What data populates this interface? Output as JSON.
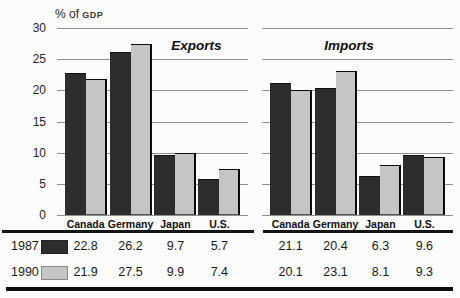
{
  "figure_title": "Exports and Imports as % of GDP, 1987 and 1990",
  "axis": {
    "unit_prefix": "% of",
    "unit_caps": "GDP",
    "ymax": 30,
    "yticks": [
      30,
      25,
      20,
      15,
      10,
      5,
      0
    ]
  },
  "chart_data": {
    "type": "bar",
    "categories": [
      "Canada",
      "Germany",
      "Japan",
      "U.S."
    ],
    "panels": [
      {
        "title": "Exports",
        "series": [
          {
            "name": "1987",
            "values": [
              22.8,
              26.2,
              9.7,
              5.7
            ]
          },
          {
            "name": "1990",
            "values": [
              21.9,
              27.5,
              9.9,
              7.4
            ]
          }
        ]
      },
      {
        "title": "Imports",
        "series": [
          {
            "name": "1987",
            "values": [
              21.1,
              20.4,
              6.3,
              9.6
            ]
          },
          {
            "name": "1990",
            "values": [
              20.1,
              23.1,
              8.1,
              9.3
            ]
          }
        ]
      }
    ],
    "ylabel": "% of GDP",
    "ylim": [
      0,
      30
    ],
    "grid": true,
    "legend_position": "bottom-table"
  },
  "colors": {
    "bar_1987": "#2d2d2d",
    "bar_1990": "#c5c5c5",
    "bar_edge": "#0a0a0a",
    "gridline": "#8f8f8f",
    "rule": "#141414",
    "text": "#1d1d1d"
  },
  "table": {
    "rows": [
      {
        "year": "1987",
        "swatch_color": "#2d2d2d",
        "values": [
          "22.8",
          "26.2",
          "9.7",
          "5.7",
          "21.1",
          "20.4",
          "6.3",
          "9.6"
        ]
      },
      {
        "year": "1990",
        "swatch_color": "#c5c5c5",
        "values": [
          "21.9",
          "27.5",
          "9.9",
          "7.4",
          "20.1",
          "23.1",
          "8.1",
          "9.3"
        ]
      }
    ]
  }
}
